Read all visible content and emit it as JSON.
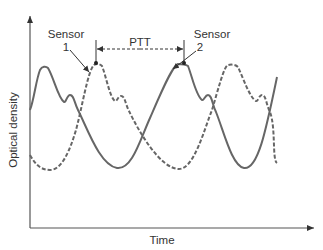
{
  "diagram": {
    "x_axis": {
      "label": "Time"
    },
    "y_axis": {
      "label": "Optical density"
    },
    "labels": {
      "sensor1_line1": "Sensor",
      "sensor1_line2": "1",
      "sensor2_line1": "Sensor",
      "sensor2_line2": "2",
      "ptt": "PTT"
    },
    "series": [
      {
        "name": "Sensor 1 waveform",
        "style": "dashed"
      },
      {
        "name": "Sensor 2 waveform",
        "style": "solid"
      }
    ],
    "colors": {
      "line": "#666666",
      "text": "#333333",
      "axis": "#555555"
    }
  }
}
